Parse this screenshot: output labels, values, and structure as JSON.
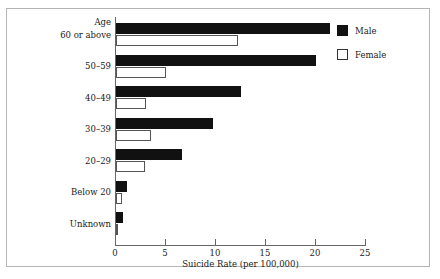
{
  "chart_data": {
    "type": "bar",
    "orientation": "horizontal",
    "title": "",
    "xlabel": "Suicide Rate (per 100,000)",
    "ylabel": "Age",
    "categories": [
      "60 or above",
      "50–59",
      "40–49",
      "30–39",
      "20–29",
      "Below 20",
      "Unknown"
    ],
    "series": [
      {
        "name": "Male",
        "color": "#111111",
        "values": [
          21.4,
          20.0,
          12.5,
          9.7,
          6.6,
          1.1,
          0.7
        ]
      },
      {
        "name": "Female",
        "color": "#ffffff",
        "values": [
          12.2,
          5.0,
          3.0,
          3.5,
          2.9,
          0.55,
          0.1
        ]
      }
    ],
    "xticks": [
      0,
      5,
      10,
      15,
      20,
      25
    ],
    "xtick_labels": [
      "0",
      "5",
      "10",
      "15",
      "20",
      "25"
    ],
    "xlim": [
      0,
      25
    ],
    "grid": false,
    "legend_position": "top-right",
    "legend": [
      "Male",
      "Female"
    ]
  },
  "legend": {
    "male_label": "Male",
    "female_label": "Female"
  },
  "axes": {
    "y_axis_title": "Age",
    "x_axis_title": "Suicide Rate (per 100,000)"
  }
}
